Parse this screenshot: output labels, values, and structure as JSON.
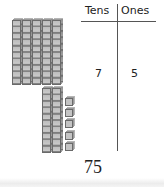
{
  "table": {
    "headers": [
      "Tens",
      "Ones"
    ],
    "values": [
      "7",
      "5"
    ]
  },
  "total": "75",
  "blocks": {
    "tens_rods_top": 5,
    "tens_rods_bottom": 2,
    "ones_cubes": 5,
    "cubes_per_rod": 10
  },
  "colors": {
    "cube_face": "#c4c4c4",
    "cube_edge": "#6a6a6a",
    "text": "#222222",
    "lines": "#555555"
  }
}
